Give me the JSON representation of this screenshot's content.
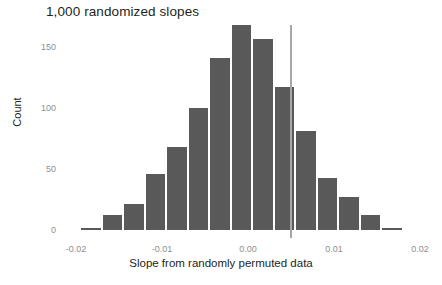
{
  "chart_data": {
    "type": "bar",
    "title": "1,000 randomized slopes",
    "xlabel": "Slope from randomly permuted data",
    "ylabel": "Count",
    "xlim": [
      -0.0225,
      0.0225
    ],
    "ylim": [
      0,
      175
    ],
    "grid": false,
    "legend": null,
    "bin_width": 0.0025,
    "bar_color": "#595959",
    "categories": [
      "-0.0195",
      "-0.0170",
      "-0.0145",
      "-0.0120",
      "-0.0095",
      "-0.0070",
      "-0.0045",
      "-0.0020",
      "0.0005",
      "0.0030",
      "0.0055",
      "0.0080",
      "0.0105",
      "0.0130",
      "0.0155",
      "0.0180"
    ],
    "bin_left_edges": [
      -0.0195,
      -0.017,
      -0.0145,
      -0.012,
      -0.0095,
      -0.007,
      -0.0045,
      -0.002,
      0.0005,
      0.003,
      0.0055,
      0.008,
      0.0105,
      0.013,
      0.0155,
      0.018
    ],
    "values": [
      2,
      12,
      21,
      46,
      68,
      100,
      141,
      168,
      157,
      117,
      81,
      43,
      27,
      12,
      2,
      0
    ],
    "xticks": [
      -0.02,
      -0.01,
      0.0,
      0.01,
      0.02
    ],
    "xticklabels": [
      "-0.02",
      "-0.01",
      "0.00",
      "0.01",
      "0.02"
    ],
    "yticks": [
      0,
      50,
      100,
      150
    ],
    "yticklabels": [
      "0",
      "50",
      "100",
      "150"
    ],
    "annotations": [
      {
        "name": "observed-slope-line",
        "type": "vline",
        "x": 0.005,
        "color": "#a6a6a6",
        "label": ""
      }
    ]
  },
  "figure": {
    "background": "#ffffff",
    "axis_label_color": "#8d8f91",
    "text_color": "#231f20"
  }
}
